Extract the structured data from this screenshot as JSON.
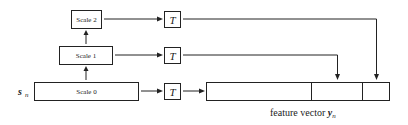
{
  "diagram": {
    "input": {
      "symbol": "s",
      "subscript": "n"
    },
    "scales": [
      {
        "label": "Scale 0"
      },
      {
        "label": "Scale 1"
      },
      {
        "label": "Scale 2"
      }
    ],
    "transform": {
      "label": "T"
    },
    "output": {
      "caption_prefix": "feature vector ",
      "symbol": "y",
      "subscript": "n",
      "segments": 3
    },
    "colors": {
      "stroke": "#222222",
      "background": "#ffffff"
    }
  }
}
